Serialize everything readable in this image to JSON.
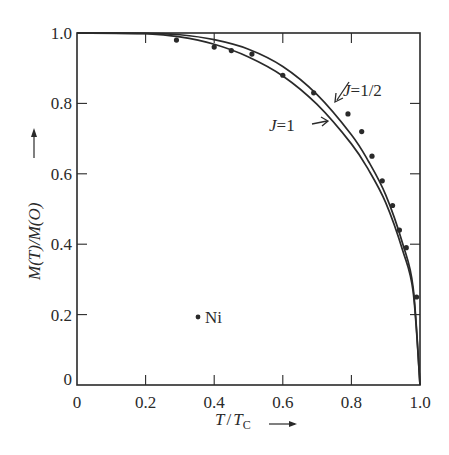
{
  "chart_data": {
    "type": "line",
    "title": "",
    "xlabel": "T/T_C",
    "ylabel": "M(T)/M(O)",
    "xlim": [
      0,
      1.0
    ],
    "ylim": [
      0,
      1.0
    ],
    "grid": false,
    "legend": "none (curves labeled inline with arrows)",
    "x_ticks": [
      "0",
      "0.2",
      "0.4",
      "0.6",
      "0.8",
      "1.0"
    ],
    "y_ticks": [
      "0",
      "0.2",
      "0.4",
      "0.6",
      "0.8",
      "1.0"
    ],
    "series": [
      {
        "name": "J=1/2",
        "kind": "theory-curve",
        "x": [
          0,
          0.2,
          0.3,
          0.4,
          0.5,
          0.6,
          0.7,
          0.8,
          0.85,
          0.9,
          0.95,
          0.98,
          1.0
        ],
        "y": [
          1.0,
          0.999,
          0.995,
          0.981,
          0.954,
          0.905,
          0.825,
          0.711,
          0.635,
          0.54,
          0.4,
          0.277,
          0.0
        ]
      },
      {
        "name": "J=1",
        "kind": "theory-curve",
        "x": [
          0,
          0.2,
          0.3,
          0.4,
          0.5,
          0.6,
          0.7,
          0.8,
          0.85,
          0.9,
          0.95,
          0.98,
          1.0
        ],
        "y": [
          1.0,
          0.998,
          0.989,
          0.968,
          0.932,
          0.878,
          0.797,
          0.685,
          0.611,
          0.518,
          0.381,
          0.265,
          0.0
        ]
      },
      {
        "name": "Ni",
        "kind": "experimental-points",
        "x": [
          0.29,
          0.4,
          0.45,
          0.51,
          0.6,
          0.69,
          0.79,
          0.83,
          0.86,
          0.89,
          0.92,
          0.94,
          0.96,
          0.99
        ],
        "y": [
          0.98,
          0.96,
          0.95,
          0.94,
          0.88,
          0.83,
          0.77,
          0.72,
          0.65,
          0.58,
          0.51,
          0.44,
          0.39,
          0.25
        ]
      }
    ],
    "annotations": [
      {
        "text": "J=1/2",
        "arrow_to": "upper curve near T/Tc≈0.76"
      },
      {
        "text": "J=1",
        "arrow_to": "lower curve near T/Tc≈0.71"
      },
      {
        "text": "• Ni",
        "position": "legend marker at T/Tc≈0.35, M≈0.19"
      }
    ]
  },
  "labels": {
    "xlabel_main": "T",
    "xlabel_slash": "/",
    "xlabel_T": "T",
    "xlabel_sub": "C",
    "ylabel": "M(T)/M(O)",
    "j_half_prefix": "J",
    "j_half_value": "=1/2",
    "j_one_prefix": "J",
    "j_one_value": "=1",
    "ni_label": "Ni"
  },
  "colors": {
    "ink": "#2a2a2a",
    "background": "#ffffff"
  }
}
